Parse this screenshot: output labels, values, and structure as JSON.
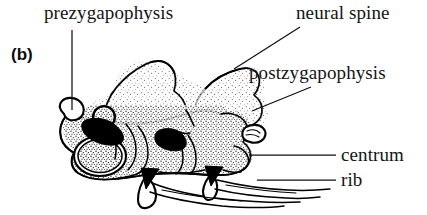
{
  "figure": {
    "panel_tag": "(b)",
    "background_color": "#ffffff",
    "ink_color": "#000000"
  },
  "labels": {
    "prezygapophysis": "prezygapophysis",
    "neural_spine": "neural spine",
    "postzygapophysis": "postzygapophysis",
    "centrum": "centrum",
    "rib": "rib"
  },
  "leaders": [
    {
      "name": "prezygapophysis-leader",
      "from": [
        72,
        30
      ],
      "to": [
        72,
        110
      ],
      "style": "vertical"
    },
    {
      "name": "neural-spine-leader",
      "from": [
        300,
        27
      ],
      "to": [
        234,
        69
      ],
      "style": "diagonal"
    },
    {
      "name": "postzygapophysis-leader",
      "from": [
        311,
        87
      ],
      "to": [
        252,
        111
      ],
      "style": "diagonal"
    },
    {
      "name": "centrum-leader",
      "from": [
        336,
        155
      ],
      "to": [
        249,
        155
      ],
      "style": "horizontal"
    },
    {
      "name": "rib-leader",
      "from": [
        336,
        180
      ],
      "to": [
        257,
        180
      ],
      "style": "horizontal"
    }
  ]
}
